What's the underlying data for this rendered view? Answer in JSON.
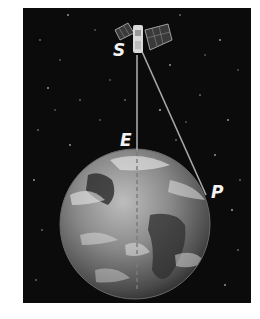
{
  "diagram": {
    "labels": {
      "satellite": "S",
      "nadir_point": "E",
      "tangent_point": "P"
    },
    "colors": {
      "space": "#0b0b0b",
      "earth_light": "#cfcfcf",
      "earth_dark": "#3a3a3a",
      "line": "#a8a8a8",
      "label": "#f2f2f2",
      "page": "#ffffff"
    }
  }
}
